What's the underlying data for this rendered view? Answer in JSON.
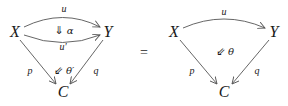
{
  "diagram": {
    "type": "commutative-diagram-2-cell-equation",
    "stroke_color": "#555555",
    "text_color": "#1a1a1a",
    "equals_sign": "=",
    "left": {
      "objects": {
        "X": "X",
        "Y": "Y",
        "C": "C"
      },
      "morphisms": {
        "u": "u",
        "u_prime": "u′",
        "p": "p",
        "q": "q"
      },
      "two_cells": {
        "alpha": {
          "arrow": "⇓",
          "label": "α"
        },
        "theta_prime": {
          "arrow": "⇙",
          "label": "θ′"
        }
      }
    },
    "right": {
      "objects": {
        "X": "X",
        "Y": "Y",
        "C": "C"
      },
      "morphisms": {
        "u": "u",
        "p": "p",
        "q": "q"
      },
      "two_cells": {
        "theta": {
          "arrow": "⇙",
          "label": "θ"
        }
      }
    }
  }
}
